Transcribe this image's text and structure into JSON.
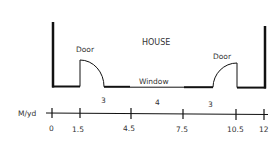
{
  "diagram": {
    "title": "HOUSE",
    "labels": {
      "door_left": "Door",
      "door_right": "Door",
      "window": "Window"
    },
    "segments": [
      "3",
      "4",
      "3"
    ],
    "axis": {
      "unit_label": "M/yd",
      "ticks": [
        "0",
        "1.5",
        "4.5",
        "7.5",
        "10.5",
        "12"
      ]
    },
    "colors": {
      "line": "#111111",
      "text": "#333333",
      "background": "#ffffff"
    }
  }
}
